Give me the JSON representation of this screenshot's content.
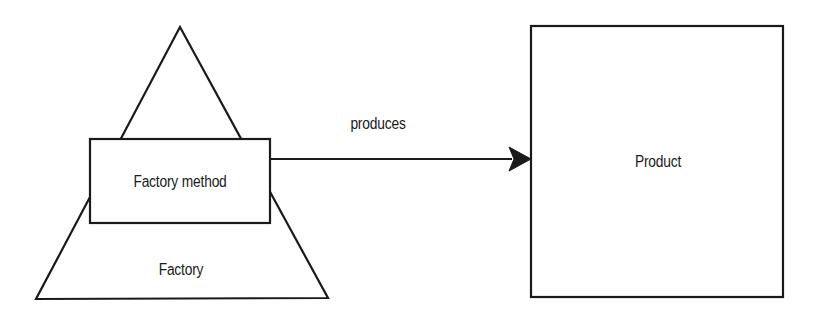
{
  "diagram": {
    "type": "factory-method-pattern",
    "colors": {
      "stroke": "#1a1a1a",
      "background": "#ffffff",
      "text": "#1a1a1a"
    },
    "nodes": {
      "factory": {
        "label": "Factory",
        "shape": "triangle"
      },
      "factory_method": {
        "label": "Factory method",
        "shape": "rectangle"
      },
      "product": {
        "label": "Product",
        "shape": "rectangle"
      }
    },
    "edges": [
      {
        "from": "factory_method",
        "to": "product",
        "label": "produces",
        "arrow": "filled"
      }
    ]
  }
}
